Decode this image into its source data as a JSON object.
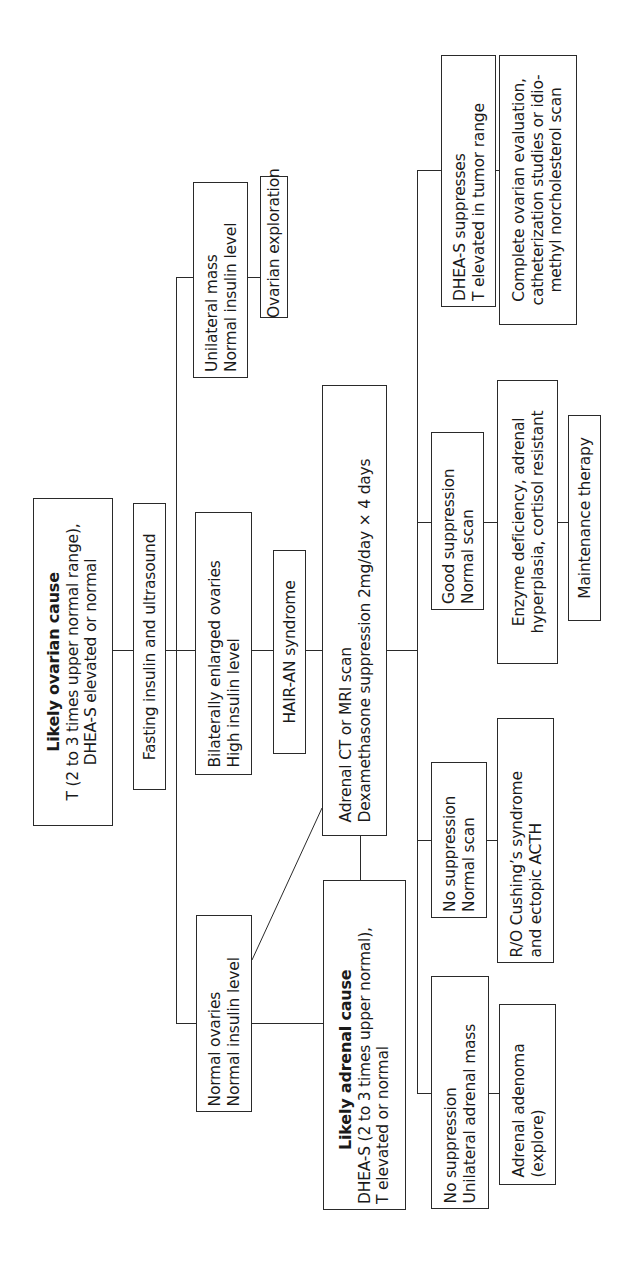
{
  "diagram": {
    "orientation": "rotated 90 degrees counter-clockwise (text reads bottom to top)",
    "ovarian_branch": {
      "likely_ovarian_cause": {
        "title": "Likely ovarian cause",
        "line1": "T (2 to 3 times upper normal range),",
        "line2": "DHEA-S elevated or normal"
      },
      "fasting_insulin": "Fasting insulin and ultrasound",
      "unilateral_mass": {
        "line1": "Unilateral mass",
        "line2": "Normal insulin level"
      },
      "ovarian_exploration": "Ovarian exploration",
      "bilaterally_enlarged": {
        "line1": "Bilaterally enlarged ovaries",
        "line2": "High insulin level"
      },
      "hair_an": "HAIR-AN syndrome",
      "normal_ovaries": {
        "line1": "Normal ovaries",
        "line2": "Normal insulin level"
      }
    },
    "adrenal_branch": {
      "likely_adrenal_cause": {
        "title": "Likely adrenal cause",
        "line1": "DHEA-S (2 to 3 times upper normal),",
        "line2": "T elevated or normal"
      },
      "adrenal_ct": {
        "line1": "Adrenal CT or MRI scan",
        "line2": "Dexamethasone suppression 2mg/day × 4 days"
      },
      "dhea_suppresses": {
        "line1": "DHEA-S suppresses",
        "line2": "T elevated in tumor range"
      },
      "complete_ovarian_eval": {
        "line1": "Complete ovarian evaluation,",
        "line2": "catheterization studies or idio-",
        "line3": "methyl norcholesterol scan"
      },
      "good_suppression": {
        "line1": "Good suppression",
        "line2": "Normal scan"
      },
      "enzyme_deficiency": {
        "line1": "Enzyme deficiency, adrenal",
        "line2": "hyperplasia, cortisol resistant"
      },
      "maintenance_therapy": "Maintenance therapy",
      "no_suppression_normal": {
        "line1": "No suppression",
        "line2": "Normal scan"
      },
      "ro_cushings": {
        "line1": "R/O Cushing’s syndrome",
        "line2": "and ectopic ACTH"
      },
      "no_suppression_unilateral": {
        "line1": "No suppression",
        "line2": "Unilateral adrenal mass"
      },
      "adrenal_adenoma": {
        "line1": "Adrenal adenoma",
        "line2": "(explore)"
      }
    },
    "colors": {
      "line": "#2a2a2a",
      "background": "#ffffff",
      "text": "#1a1a1a"
    }
  }
}
